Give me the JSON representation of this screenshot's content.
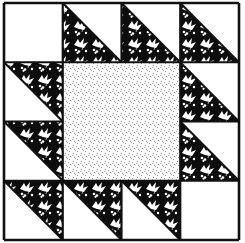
{
  "grid": {
    "rows": 4,
    "cols": 4
  },
  "colors": {
    "background": "#ffffff",
    "outline": "#111111",
    "print_dark": "#0d0d0d",
    "print_light": "#ffffff",
    "center_dots": "#7a7a7a"
  },
  "fabrics": {
    "plain": "white solid",
    "print": "black-and-white grape-and-leaf print",
    "center": "light gray stipple print"
  },
  "cells": [
    {
      "row": 0,
      "col": 0,
      "type": "plain"
    },
    {
      "row": 0,
      "col": 1,
      "type": "hst",
      "dark": "lower-left"
    },
    {
      "row": 0,
      "col": 2,
      "type": "hst",
      "dark": "lower-left"
    },
    {
      "row": 0,
      "col": 3,
      "type": "hst",
      "dark": "lower-left"
    },
    {
      "row": 1,
      "col": 0,
      "type": "hst",
      "dark": "upper-right"
    },
    {
      "row": 1,
      "col": 3,
      "type": "hst",
      "dark": "lower-left"
    },
    {
      "row": 2,
      "col": 0,
      "type": "hst",
      "dark": "upper-right"
    },
    {
      "row": 2,
      "col": 3,
      "type": "hst",
      "dark": "lower-left"
    },
    {
      "row": 3,
      "col": 0,
      "type": "hst",
      "dark": "upper-right"
    },
    {
      "row": 3,
      "col": 1,
      "type": "hst",
      "dark": "upper-right"
    },
    {
      "row": 3,
      "col": 2,
      "type": "hst",
      "dark": "upper-right"
    },
    {
      "row": 3,
      "col": 3,
      "type": "plain"
    }
  ],
  "center": {
    "row": 1,
    "col": 1,
    "span": 2,
    "type": "center"
  }
}
